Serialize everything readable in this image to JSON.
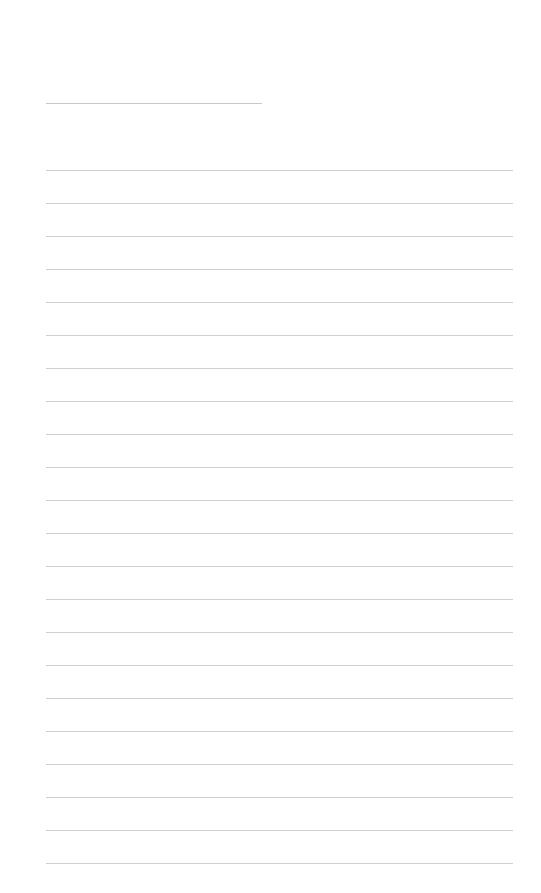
{
  "page": {
    "type": "lined-paper",
    "title_line": {
      "x": 46,
      "y": 103,
      "width": 216
    },
    "rules": {
      "count": 22,
      "start_y": 170,
      "spacing": 33,
      "x": 46,
      "width": 467,
      "color": "#cfcfcf"
    }
  }
}
